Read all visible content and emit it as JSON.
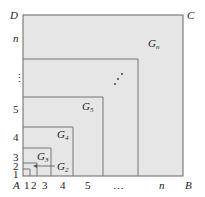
{
  "figure": {
    "corners": {
      "A": "A",
      "B": "B",
      "C": "C",
      "D": "D"
    },
    "x_ticks": [
      "1",
      "2",
      "3",
      "4",
      "5",
      "…",
      "n"
    ],
    "y_ticks": [
      "1",
      "2",
      "3",
      "4",
      "5",
      "⋮",
      "n"
    ],
    "regions": [
      {
        "name": "G",
        "sub": "2"
      },
      {
        "name": "G",
        "sub": "3"
      },
      {
        "name": "G",
        "sub": "4"
      },
      {
        "name": "G",
        "sub": "5"
      },
      {
        "name": "G",
        "sub": "n"
      }
    ],
    "diag_dots": "⋰",
    "colors": {
      "fill": "#e6e6e6",
      "stroke": "#666666"
    }
  }
}
